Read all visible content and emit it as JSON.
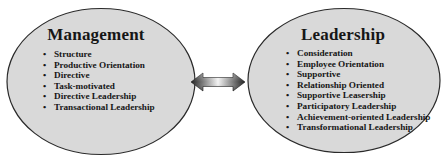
{
  "diagram": {
    "colors": {
      "ellipse_fill": "#d9d9d9",
      "ellipse_stroke": "#2a2a2a",
      "text": "#161616",
      "arrow_dark": "#1e1e1e",
      "arrow_light": "#f4f4f4",
      "background": "#ffffff"
    },
    "connector": {
      "type": "double-headed-arrow",
      "icon": "double-arrow-icon"
    },
    "management": {
      "title": "Management",
      "items": [
        "Structure",
        "Productive Orientation",
        "Directive",
        "Task-motivated",
        "Directive Leadership",
        "Transactional Leadership"
      ]
    },
    "leadership": {
      "title": "Leadership",
      "items": [
        "Consideration",
        "Employee Orientation",
        "Supportive",
        "Relationship Oriented",
        "Supportive Leasership",
        "Participatory Leadership",
        "Achievement-oriented Leadership",
        "Transformational Leadership"
      ]
    }
  }
}
